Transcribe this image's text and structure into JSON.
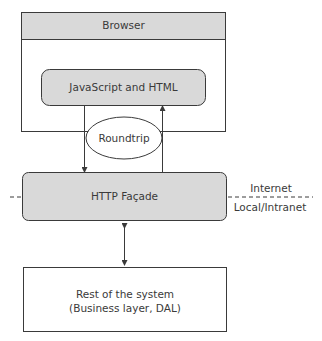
{
  "diagram": {
    "browser": {
      "label": "Browser"
    },
    "client_code": {
      "label": "JavaScript and HTML"
    },
    "roundtrip": {
      "label": "Roundtrip"
    },
    "facade": {
      "label": "HTTP Façade"
    },
    "boundary": {
      "upper_label": "Internet",
      "lower_label": "Local/Intranet"
    },
    "backend": {
      "line1": "Rest of the system",
      "line2": "(Business layer, DAL)"
    }
  },
  "colors": {
    "box_fill": "#d9d9d9",
    "stroke": "#3a3a3a",
    "background": "#ffffff"
  }
}
